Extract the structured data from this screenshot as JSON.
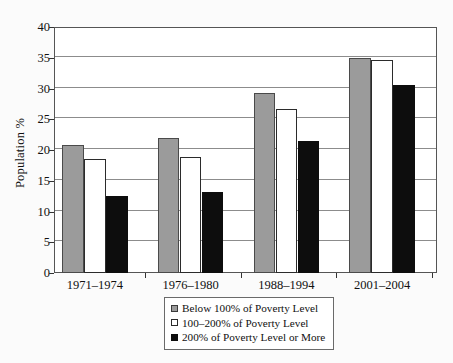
{
  "chart_data": {
    "type": "bar",
    "title": "",
    "subtitle": "",
    "xlabel": "",
    "ylabel": "Population %",
    "ylim": [
      0,
      40
    ],
    "ytick_step": 5,
    "yticks": [
      "0",
      "5",
      "10",
      "15",
      "20",
      "25",
      "30",
      "35",
      "40"
    ],
    "grid": true,
    "legend_position": "bottom-center",
    "categories": [
      "1971–1974",
      "1976–1980",
      "1988–1994",
      "2001–2004"
    ],
    "series": [
      {
        "name": "Below 100% of Poverty Level",
        "color": "#9b9b9b",
        "swatch": "gray-filled-square",
        "values": [
          20.8,
          22.0,
          29.3,
          35.0
        ]
      },
      {
        "name": "100–200% of Poverty Level",
        "color": "#ffffff",
        "swatch": "white-outlined-square",
        "values": [
          18.5,
          18.9,
          26.6,
          34.7
        ]
      },
      {
        "name": "200% of Poverty Level or More",
        "color": "#0d0d0d",
        "swatch": "black-filled-square",
        "values": [
          12.6,
          13.2,
          21.5,
          30.6
        ]
      }
    ]
  },
  "axis": {
    "y_title": "Population %"
  },
  "legend": {
    "items": [
      {
        "label": "Below 100% of Poverty Level"
      },
      {
        "label": "100–200% of Poverty Level"
      },
      {
        "label": "200% of Poverty Level or More"
      }
    ]
  }
}
